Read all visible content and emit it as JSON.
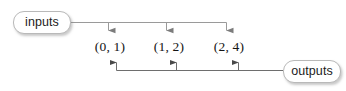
{
  "diagram": {
    "background_color": "#ffffff",
    "stroke_color": "#8a8a8a",
    "box_border_color": "#b9b9b9",
    "text_color": "#141414",
    "nodes": {
      "input_box_label": "inputs",
      "output_box_label": "outputs"
    },
    "pairs": [
      {
        "label": "(0, 1)",
        "x": 0,
        "y": 1
      },
      {
        "label": "(1, 2)",
        "x": 1,
        "y": 2
      },
      {
        "label": "(2, 4)",
        "x": 2,
        "y": 4
      }
    ],
    "arrows": {
      "down_count": 3,
      "up_count": 3,
      "down_direction": "inputs-to-pairs",
      "up_direction": "outputs-to-pairs"
    }
  }
}
